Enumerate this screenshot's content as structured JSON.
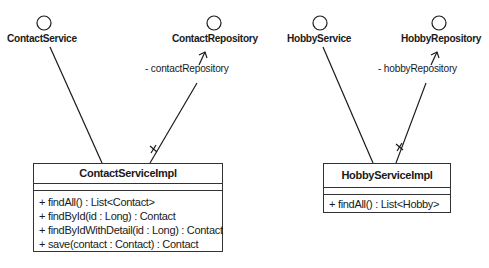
{
  "interfaces": [
    {
      "name": "ContactService"
    },
    {
      "name": "ContactRepository"
    },
    {
      "name": "HobbyService"
    },
    {
      "name": "HobbyRepository"
    }
  ],
  "associations": [
    {
      "role": "- contactRepository",
      "multiplicity": "*"
    },
    {
      "role": "- hobbyRepository",
      "multiplicity": "*"
    }
  ],
  "classes": [
    {
      "name": "ContactServiceImpl",
      "operations": [
        "+ findAll() : List<Contact>",
        "+ findById(id : Long) : Contact",
        "+ findByIdWithDetail(id : Long) : Contact",
        "+ save(contact : Contact) : Contact"
      ]
    },
    {
      "name": "HobbyServiceImpl",
      "operations": [
        "+ findAll() : List<Hobby>"
      ]
    }
  ],
  "colors": {
    "line": "#1a1a1a",
    "background": "#ffffff"
  }
}
